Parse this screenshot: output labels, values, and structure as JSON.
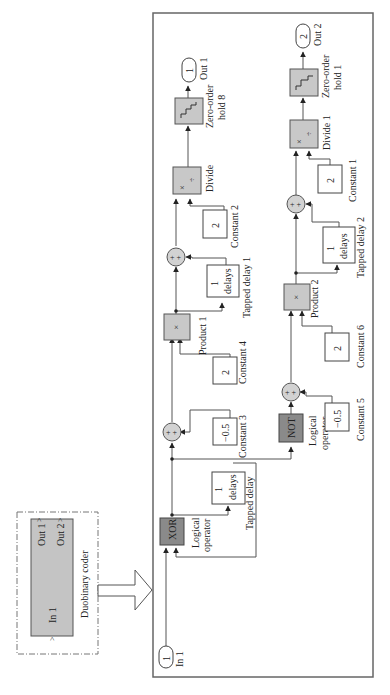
{
  "subsystem": {
    "name": "Duobinary coder",
    "ports_in": [
      "In 1"
    ],
    "ports_out": [
      "Out 1",
      "Out 2"
    ]
  },
  "inports": [
    {
      "id": "1",
      "label": "In 1"
    }
  ],
  "outports": [
    {
      "id": "1",
      "label": "Out 1"
    },
    {
      "id": "2",
      "label": "Out 2"
    }
  ],
  "blocks": {
    "xor": {
      "text": "XOR",
      "label_1": "Logical",
      "label_2": "operator"
    },
    "not": {
      "text": "NOT",
      "label_1": "Logical",
      "label_2": "operator"
    },
    "tapped_delay": {
      "line1": "1",
      "line2": "delays",
      "label": "Tapped delay"
    },
    "tapped_delay_1": {
      "line1": "1",
      "line2": "delays",
      "label": "Tapped delay 1"
    },
    "tapped_delay_2": {
      "line1": "1",
      "line2": "delays",
      "label": "Tapped delay 2"
    },
    "constant_3": {
      "value": "−0.5",
      "label": "Constant 3"
    },
    "constant_4": {
      "value": "2",
      "label": "Constant 4"
    },
    "constant_5": {
      "value": "−0.5",
      "label": "Constant 5"
    },
    "constant_6": {
      "value": "2",
      "label": "Constant 6"
    },
    "constant_2": {
      "value": "2",
      "label": "Constant 2"
    },
    "constant_1": {
      "value": "2",
      "label": "Constant 1"
    },
    "product_1": {
      "symbol": "×",
      "label": "Product 1"
    },
    "product_2": {
      "symbol": "×",
      "label": "Product 2"
    },
    "divide": {
      "sym1": "×",
      "sym2": "÷",
      "label": "Divide"
    },
    "divide_1": {
      "sym1": "×",
      "sym2": "÷",
      "label": "Divide 1"
    },
    "zoh_8": {
      "label_1": "Zero-order",
      "label_2": "hold 8"
    },
    "zoh_1": {
      "label_1": "Zero-order",
      "label_2": "hold 1"
    },
    "sum_signs": "+ +"
  },
  "colors": {
    "logic_block": "#8a8a8a",
    "math_block": "#c8c8c8",
    "wire": "#555555"
  }
}
